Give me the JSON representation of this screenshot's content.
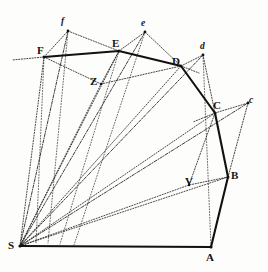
{
  "figure": {
    "background_color": "#fdfdfc",
    "ink_color": "#141414"
  },
  "labels": {
    "S": "S",
    "A": "A",
    "B": "B",
    "C": "C",
    "D": "D",
    "E": "E",
    "F": "F",
    "V": "V",
    "Z": "Z",
    "c": "c",
    "d": "d",
    "e": "e",
    "f": "f"
  },
  "label_positions": {
    "S": {
      "x": 8,
      "y": 240,
      "case": "upper"
    },
    "A": {
      "x": 206,
      "y": 252,
      "case": "upper"
    },
    "B": {
      "x": 231,
      "y": 170,
      "case": "upper"
    },
    "C": {
      "x": 213,
      "y": 100,
      "case": "upper"
    },
    "D": {
      "x": 172,
      "y": 56,
      "case": "upper"
    },
    "E": {
      "x": 112,
      "y": 38,
      "case": "upper"
    },
    "F": {
      "x": 37,
      "y": 45,
      "case": "upper"
    },
    "V": {
      "x": 185,
      "y": 176,
      "case": "upper"
    },
    "Z": {
      "x": 90,
      "y": 76,
      "case": "upper"
    },
    "c": {
      "x": 249,
      "y": 96,
      "case": "lower"
    },
    "d": {
      "x": 200,
      "y": 42,
      "case": "lower"
    },
    "e": {
      "x": 141,
      "y": 19,
      "case": "lower"
    },
    "f": {
      "x": 61,
      "y": 17,
      "case": "lower"
    }
  },
  "points": {
    "S": {
      "x": 20,
      "y": 246
    },
    "A": {
      "x": 211,
      "y": 247
    },
    "B": {
      "x": 228,
      "y": 177
    },
    "C": {
      "x": 215,
      "y": 113
    },
    "D": {
      "x": 181,
      "y": 66
    },
    "E": {
      "x": 119,
      "y": 51
    },
    "F": {
      "x": 44,
      "y": 57
    },
    "V": {
      "x": 189,
      "y": 185
    },
    "Z": {
      "x": 101,
      "y": 84
    },
    "c": {
      "x": 248,
      "y": 103
    },
    "d": {
      "x": 203,
      "y": 55
    },
    "e": {
      "x": 145,
      "y": 32
    },
    "f": {
      "x": 68,
      "y": 31
    },
    "Fext": {
      "x": 12,
      "y": 60
    },
    "Dext": {
      "x": 196,
      "y": 71
    }
  },
  "orbit_path": {
    "description": "Heavy polygonal orbit S-A-B-C-D-E-F",
    "vertices": [
      "S",
      "A",
      "B",
      "C",
      "D",
      "E",
      "F"
    ]
  },
  "radii": {
    "description": "Dotted radii drawn from the centre of force S",
    "targets": [
      "B",
      "C",
      "D",
      "E",
      "F",
      "c",
      "d",
      "e",
      "f",
      "V",
      "Z"
    ]
  },
  "constructions": [
    {
      "name": "parallelogram-BcCV",
      "vertices": [
        "C",
        "c",
        "B",
        "V"
      ]
    },
    {
      "name": "parallelogram-DdEZ",
      "vertices": [
        "D",
        "d",
        "C",
        "Z"
      ]
    },
    {
      "name": "tangent-triangle-e",
      "vertices": [
        "E",
        "e",
        "D"
      ]
    },
    {
      "name": "tangent-triangle-f",
      "vertices": [
        "F",
        "f",
        "E"
      ]
    },
    {
      "name": "chord-FZ",
      "vertices": [
        "F",
        "Z"
      ]
    },
    {
      "name": "chord-ZD",
      "vertices": [
        "Z",
        "D"
      ]
    },
    {
      "name": "baseline-SA",
      "vertices": [
        "S",
        "A"
      ]
    }
  ]
}
